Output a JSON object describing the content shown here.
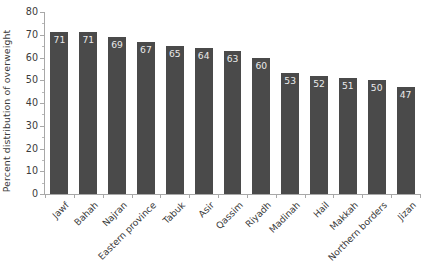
{
  "chart_data": {
    "type": "bar",
    "title": "",
    "xlabel": "",
    "ylabel": "Percent distribution of overweight",
    "ylim": [
      0,
      80
    ],
    "ytick_step": 10,
    "grid": false,
    "legend": null,
    "bar_color": "#4a4a4a",
    "value_label_color": "#e9e9e9",
    "axis_color": "#a8a8a8",
    "text_color": "#3b3b3b",
    "xtick_rotation": -45,
    "categories": [
      "Jawf",
      "Bahah",
      "Najran",
      "Eastern province",
      "Tabuk",
      "Asir",
      "Qassim",
      "Riyadh",
      "Madinah",
      "Hail",
      "Makkah",
      "Northern borders",
      "Jizan"
    ],
    "values": [
      71,
      71,
      69,
      67,
      65,
      64,
      63,
      60,
      53,
      52,
      51,
      50,
      47
    ],
    "ytick_labels": [
      "0",
      "10",
      "20",
      "30",
      "40",
      "50",
      "60",
      "70",
      "80"
    ],
    "ytick_values": [
      0,
      10,
      20,
      30,
      40,
      50,
      60,
      70,
      80
    ]
  }
}
